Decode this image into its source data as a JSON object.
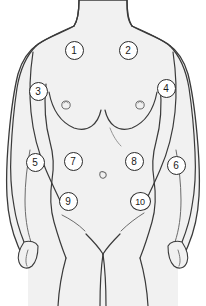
{
  "illustration": {
    "title": "Female anterior torso with numbered examination sites",
    "subject": "female-torso-front-view",
    "view": "anterior",
    "canvas": {
      "width": 206,
      "height": 306
    },
    "colors": {
      "background": "#ffffff",
      "skin_fill": "#f1f1f1",
      "outline": "#3a3a3a",
      "detail_line": "#6b6b6b",
      "marker_fill": "#ffffff",
      "marker_stroke": "#2b2b2b",
      "marker_text": "#1a1a1a"
    }
  },
  "markers": [
    {
      "id": "marker-1",
      "label": "1",
      "x": 74,
      "y": 50,
      "region": "right-upper-chest"
    },
    {
      "id": "marker-2",
      "label": "2",
      "x": 128,
      "y": 50,
      "region": "left-upper-chest"
    },
    {
      "id": "marker-3",
      "label": "3",
      "x": 38,
      "y": 91,
      "region": "right-axilla"
    },
    {
      "id": "marker-4",
      "label": "4",
      "x": 166,
      "y": 88,
      "region": "left-axilla"
    },
    {
      "id": "marker-5",
      "label": "5",
      "x": 35,
      "y": 162,
      "region": "right-arm"
    },
    {
      "id": "marker-6",
      "label": "6",
      "x": 176,
      "y": 165,
      "region": "left-arm"
    },
    {
      "id": "marker-7",
      "label": "7",
      "x": 73,
      "y": 161,
      "region": "right-upper-abdomen"
    },
    {
      "id": "marker-8",
      "label": "8",
      "x": 134,
      "y": 161,
      "region": "left-upper-abdomen"
    },
    {
      "id": "marker-9",
      "label": "9",
      "x": 68,
      "y": 201,
      "region": "right-lower-abdomen"
    },
    {
      "id": "marker-10",
      "label": "10",
      "x": 140,
      "y": 201,
      "region": "left-lower-abdomen"
    }
  ],
  "anatomy_features": [
    {
      "name": "neck",
      "visible": true
    },
    {
      "name": "right-breast",
      "visible": true
    },
    {
      "name": "left-breast",
      "visible": true
    },
    {
      "name": "right-nipple",
      "visible": true
    },
    {
      "name": "left-nipple",
      "visible": true
    },
    {
      "name": "navel",
      "visible": true
    },
    {
      "name": "right-inguinal-crease",
      "visible": true
    },
    {
      "name": "left-inguinal-crease",
      "visible": true
    },
    {
      "name": "pubic-region",
      "visible": true
    },
    {
      "name": "right-arm",
      "visible": true
    },
    {
      "name": "left-arm",
      "visible": true
    },
    {
      "name": "right-hand",
      "visible": true
    },
    {
      "name": "left-hand",
      "visible": true
    },
    {
      "name": "right-thigh",
      "visible": true
    },
    {
      "name": "left-thigh",
      "visible": true
    }
  ]
}
